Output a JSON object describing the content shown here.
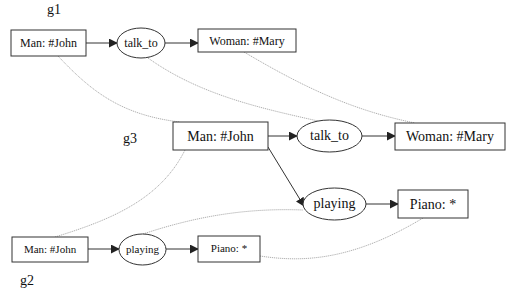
{
  "diagram": {
    "type": "conceptual-graph-projection",
    "graphs": {
      "g1": {
        "label": "g1",
        "nodes": {
          "man": "Man: #John",
          "relation": "talk_to",
          "woman": "Woman: #Mary"
        }
      },
      "g2": {
        "label": "g2",
        "nodes": {
          "man": "Man: #John",
          "relation": "playing",
          "piano": "Piano: *"
        }
      },
      "g3": {
        "label": "g3",
        "nodes": {
          "man": "Man: #John",
          "relation_talk": "talk_to",
          "woman": "Woman: #Mary",
          "relation_play": "playing",
          "piano": "Piano: *"
        }
      }
    },
    "edges": [
      {
        "graph": "g1",
        "from": "Man: #John",
        "to": "talk_to"
      },
      {
        "graph": "g1",
        "from": "talk_to",
        "to": "Woman: #Mary"
      },
      {
        "graph": "g2",
        "from": "Man: #John",
        "to": "playing"
      },
      {
        "graph": "g2",
        "from": "playing",
        "to": "Piano: *"
      },
      {
        "graph": "g3",
        "from": "Man: #John",
        "to": "talk_to"
      },
      {
        "graph": "g3",
        "from": "talk_to",
        "to": "Woman: #Mary"
      },
      {
        "graph": "g3",
        "from": "Man: #John",
        "to": "playing"
      },
      {
        "graph": "g3",
        "from": "playing",
        "to": "Piano: *"
      }
    ],
    "mappings": [
      {
        "from": "g1.Man: #John",
        "to": "g3.Man: #John"
      },
      {
        "from": "g1.talk_to",
        "to": "g3.talk_to"
      },
      {
        "from": "g1.Woman: #Mary",
        "to": "g3.Woman: #Mary"
      },
      {
        "from": "g2.Man: #John",
        "to": "g3.Man: #John"
      },
      {
        "from": "g2.playing",
        "to": "g3.playing"
      },
      {
        "from": "g2.Piano: *",
        "to": "g3.Piano: *"
      }
    ]
  }
}
